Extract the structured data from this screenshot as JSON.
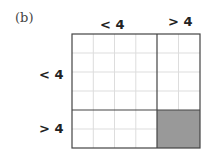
{
  "panel_label": "(b)",
  "column_headers": [
    "< 4",
    "> 4"
  ],
  "row_headers": [
    "< 4",
    "> 4"
  ],
  "grid": {
    "columns": 6,
    "rows": 6,
    "split_column": 4,
    "split_row": 4
  },
  "shaded_block": {
    "row": "> 4",
    "column": "> 4",
    "color": "#999999"
  }
}
